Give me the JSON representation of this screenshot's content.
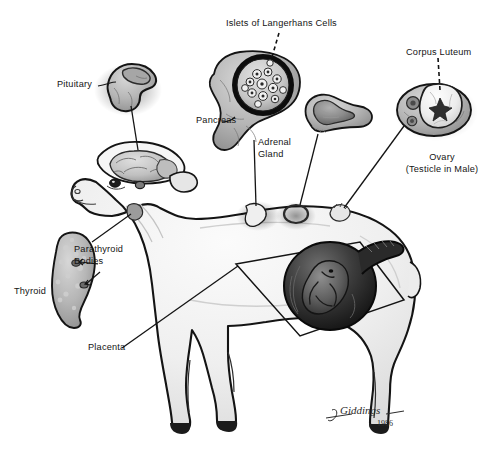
{
  "figure": {
    "background_color": "#ffffff",
    "ink_color": "#141414",
    "signature": {
      "artist": "Giddings",
      "year": "1986",
      "initials": "J.B."
    }
  },
  "labels": {
    "islets": "Islets of Langerhans Cells",
    "corpus_luteum": "Corpus Luteum",
    "pituitary": "Pituitary",
    "pancreas": "Pancreas",
    "adrenal_gland_line1": "Adrenal",
    "adrenal_gland_line2": "Gland",
    "ovary_line1": "Ovary",
    "ovary_line2": "(Testicle in Male)",
    "parathyroid_line1": "Parathyroid",
    "parathyroid_line2": "Bodies",
    "thyroid": "Thyroid",
    "placenta": "Placenta"
  },
  "insets": [
    {
      "name": "pituitary-gland",
      "label": "Pituitary"
    },
    {
      "name": "pancreas-with-islets",
      "label": "Pancreas"
    },
    {
      "name": "adrenal-gland",
      "label": "Adrenal Gland"
    },
    {
      "name": "ovary-with-corpus-luteum",
      "label": "Ovary"
    },
    {
      "name": "thyroid-with-parathyroid",
      "label": "Thyroid"
    },
    {
      "name": "gravid-uterus-placenta",
      "label": "Placenta"
    }
  ],
  "colors": {
    "outline": "#141414",
    "tissue_light": "#e8e8e8",
    "tissue_mid": "#b5b5b5",
    "tissue_dark": "#7a7a7a",
    "tissue_darkest": "#3a3a3a",
    "body_fill": "#f2f2f2",
    "body_shade": "#d9d9d9"
  }
}
